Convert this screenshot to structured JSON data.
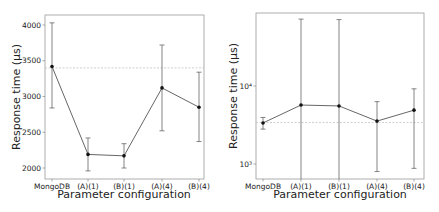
{
  "chart_data": [
    {
      "type": "line",
      "title": "",
      "xlabel": "Parameter configuration",
      "ylabel": "Response time (μs)",
      "yscale": "linear",
      "ylim": [
        1860,
        4130
      ],
      "yticks": [
        2000,
        2500,
        3000,
        3500,
        4000
      ],
      "ytick_labels": [
        "2000",
        "2500",
        "3000",
        "3500",
        "4000"
      ],
      "categories": [
        "MongoDB",
        "(A)(1)",
        "(B)(1)",
        "(A)(4)",
        "(B)(4)"
      ],
      "series": [
        {
          "name": "Response time",
          "values": [
            3420,
            2190,
            2170,
            3120,
            2850
          ],
          "error_low": [
            2840,
            1960,
            2000,
            2520,
            2370
          ],
          "error_high": [
            4030,
            2420,
            2340,
            3720,
            3340
          ]
        }
      ],
      "reference_line": {
        "y": 3400,
        "style": "dashed"
      },
      "grid": false,
      "legend": null
    },
    {
      "type": "line",
      "title": "",
      "xlabel": "Parameter configuration",
      "ylabel": "Response time (μs)",
      "yscale": "log",
      "ylim": [
        620,
        95000
      ],
      "yticks": [
        1000,
        10000
      ],
      "ytick_labels": [
        "10³",
        "10⁴"
      ],
      "categories": [
        "MongoDB",
        "(A)(1)",
        "(B)(1)",
        "(A)(4)",
        "(B)(4)"
      ],
      "series": [
        {
          "name": "Response time",
          "values": [
            3360,
            5700,
            5550,
            3550,
            4900
          ],
          "error_low": [
            2800,
            1,
            1,
            800,
            880
          ],
          "error_high": [
            3950,
            72000,
            71000,
            6300,
            9200
          ]
        }
      ],
      "reference_line": {
        "y": 3400,
        "style": "dashed"
      },
      "grid": false,
      "legend": null
    }
  ],
  "charts": {
    "left": {
      "xlabel": "Parameter configuration",
      "ylabel": "Response time (μs)",
      "ytick_labels": [
        "4000",
        "3500",
        "3000",
        "2500",
        "2000"
      ],
      "xtick_labels": [
        "MongoDB",
        "(A)(1)",
        "(B)(1)",
        "(A)(4)",
        "(B)(4)"
      ]
    },
    "right": {
      "xlabel": "Parameter configuration",
      "ylabel": "Response time (μs)",
      "ytick_labels": [
        "10⁴",
        "10³"
      ],
      "xtick_labels": [
        "MongoDB",
        "(A)(1)",
        "(B)(1)",
        "(A)(4)",
        "(B)(4)"
      ]
    }
  },
  "colors": {
    "line": "#555555",
    "marker": "#111111",
    "errorbar": "#666666",
    "reference": "#bbbbbb",
    "axis": "#888888"
  }
}
